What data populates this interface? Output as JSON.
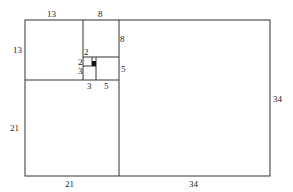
{
  "diagram": {
    "labels": {
      "top_13": "13",
      "top_8": "8",
      "left_13": "13",
      "right_8": "8",
      "small_2_top": "2",
      "small_2_left": "2",
      "small_3_left": "3",
      "right_5": "5",
      "bottom_3": "3",
      "bottom_5": "5",
      "left_21": "21",
      "right_34": "34",
      "bottom_21": "21",
      "bottom_34": "34"
    }
  }
}
